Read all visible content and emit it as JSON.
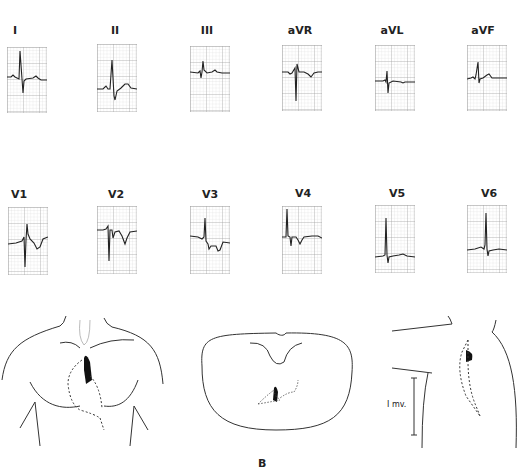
{
  "figure": {
    "panel_label": "B",
    "calibration_label": "I mv."
  },
  "limb_leads": [
    {
      "label": "I",
      "x": 8,
      "label_x": 0,
      "y": 48
    },
    {
      "label": "II",
      "x": 97,
      "label_x": 90,
      "y": 48
    },
    {
      "label": "III",
      "x": 190,
      "label_x": 180,
      "y": 46
    },
    {
      "label": "aVR",
      "x": 282,
      "label_x": 272,
      "y": 45
    },
    {
      "label": "aVL",
      "x": 375,
      "label_x": 365,
      "y": 45
    },
    {
      "label": "aVF",
      "x": 467,
      "label_x": 457,
      "y": 45
    }
  ],
  "precordial_leads": [
    {
      "label": "V1",
      "x": 8,
      "label_x": 0,
      "y": 207
    },
    {
      "label": "V2",
      "x": 97,
      "label_x": 90,
      "y": 206
    },
    {
      "label": "V3",
      "x": 190,
      "label_x": 180,
      "y": 206
    },
    {
      "label": "V4",
      "x": 282,
      "label_x": 272,
      "y": 206
    },
    {
      "label": "V5",
      "x": 375,
      "label_x": 365,
      "y": 205
    },
    {
      "label": "V6",
      "x": 467,
      "label_x": 457,
      "y": 205
    }
  ],
  "colors": {
    "grid_major": "#9a9a9a",
    "grid_minor": "#d0d0d0",
    "trace": "#222222",
    "line_art": "#333333"
  }
}
